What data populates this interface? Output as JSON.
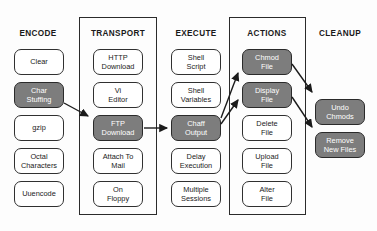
{
  "diagram": {
    "colors": {
      "shaded_fill": "#7d7d7d",
      "plain_fill": "#ffffff",
      "stroke": "#303030",
      "text_dark": "#1b1b1b",
      "text_light": "#ffffff"
    },
    "columns": [
      {
        "id": "encode",
        "title": "ENCODE",
        "framed": false,
        "nodes": [
          {
            "label": "Clear",
            "shaded": false
          },
          {
            "label": "Char\nStuffing",
            "shaded": true
          },
          {
            "label": "gzip",
            "shaded": false
          },
          {
            "label": "Octal\nCharacters",
            "shaded": false
          },
          {
            "label": "Uuencode",
            "shaded": false
          }
        ]
      },
      {
        "id": "transport",
        "title": "TRANSPORT",
        "framed": true,
        "nodes": [
          {
            "label": "HTTP\nDownload",
            "shaded": false
          },
          {
            "label": "Vi\nEditor",
            "shaded": false
          },
          {
            "label": "FTP\nDownload",
            "shaded": true
          },
          {
            "label": "Attach To\nMail",
            "shaded": false
          },
          {
            "label": "On\nFloppy",
            "shaded": false
          }
        ]
      },
      {
        "id": "execute",
        "title": "EXECUTE",
        "framed": false,
        "nodes": [
          {
            "label": "Shell\nScript",
            "shaded": false
          },
          {
            "label": "Shell\nVariables",
            "shaded": false
          },
          {
            "label": "Chaff\nOutput",
            "shaded": true
          },
          {
            "label": "Delay\nExecution",
            "shaded": false
          },
          {
            "label": "Multiple\nSessions",
            "shaded": false
          }
        ]
      },
      {
        "id": "actions",
        "title": "ACTIONS",
        "framed": true,
        "nodes": [
          {
            "label": "Chmod\nFile",
            "shaded": true
          },
          {
            "label": "Display\nFile",
            "shaded": true
          },
          {
            "label": "Delete\nFile",
            "shaded": false
          },
          {
            "label": "Upload\nFile",
            "shaded": false
          },
          {
            "label": "Alter\nFile",
            "shaded": false
          }
        ]
      },
      {
        "id": "cleanup",
        "title": "CLEANUP",
        "framed": false,
        "nodes": [
          {
            "label": "Undo\nChmods",
            "shaded": true
          },
          {
            "label": "Remove\nNew Files",
            "shaded": true
          }
        ]
      }
    ],
    "connections": [
      {
        "from": "Char Stuffing",
        "to": "FTP Download"
      },
      {
        "from": "FTP Download",
        "to": "Chaff Output"
      },
      {
        "from": "Chaff Output",
        "to": "Chmod File"
      },
      {
        "from": "Chaff Output",
        "to": "Display File"
      },
      {
        "from": "Chmod File",
        "to": "Undo Chmods"
      },
      {
        "from": "Display File",
        "to": "Remove New Files"
      }
    ]
  }
}
